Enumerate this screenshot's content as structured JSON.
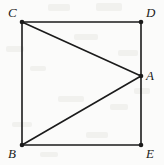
{
  "figure": {
    "type": "geometry-diagram",
    "canvas": {
      "width": 164,
      "height": 165
    },
    "background_color": "#fbfbfa",
    "stroke_color": "#1b1b1b",
    "stroke_width": 1.6,
    "vertex_dot_radius": 2.3,
    "points": [
      {
        "id": "C",
        "label": "C",
        "x": 22,
        "y": 22,
        "label_x": 8,
        "label_y": 6,
        "label_anchor": "upper-left"
      },
      {
        "id": "D",
        "label": "D",
        "x": 141,
        "y": 22,
        "label_x": 146,
        "label_y": 6,
        "label_anchor": "upper-right"
      },
      {
        "id": "A",
        "label": "A",
        "x": 141,
        "y": 76,
        "label_x": 146,
        "label_y": 69,
        "label_anchor": "right"
      },
      {
        "id": "B",
        "label": "B",
        "x": 22,
        "y": 145,
        "label_x": 8,
        "label_y": 147,
        "label_anchor": "lower-left"
      },
      {
        "id": "E",
        "label": "E",
        "x": 141,
        "y": 145,
        "label_x": 146,
        "label_y": 147,
        "label_anchor": "lower-right"
      }
    ],
    "segments": [
      {
        "name": "side-CD",
        "from": "C",
        "to": "D"
      },
      {
        "name": "side-DA",
        "from": "D",
        "to": "A"
      },
      {
        "name": "side-AE",
        "from": "A",
        "to": "E"
      },
      {
        "name": "side-EB",
        "from": "E",
        "to": "B"
      },
      {
        "name": "side-BC",
        "from": "B",
        "to": "C"
      },
      {
        "name": "diagonal-CA",
        "from": "C",
        "to": "A"
      },
      {
        "name": "diagonal-BA",
        "from": "B",
        "to": "A"
      }
    ]
  }
}
